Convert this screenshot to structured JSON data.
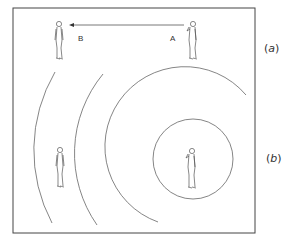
{
  "diagram": {
    "panels": [
      {
        "id": "a",
        "label": "(a)",
        "point_labels": {
          "source": "A",
          "target": "B"
        }
      },
      {
        "id": "b",
        "label": "(b)"
      }
    ],
    "labels": {
      "A": "A",
      "B": "B",
      "a_open": "(",
      "a_letter": "a",
      "a_close": ")",
      "b_open": "(",
      "b_letter": "b",
      "b_close": ")"
    },
    "colors": {
      "line": "#555555",
      "frame": "#444444",
      "background": "#ffffff"
    }
  }
}
